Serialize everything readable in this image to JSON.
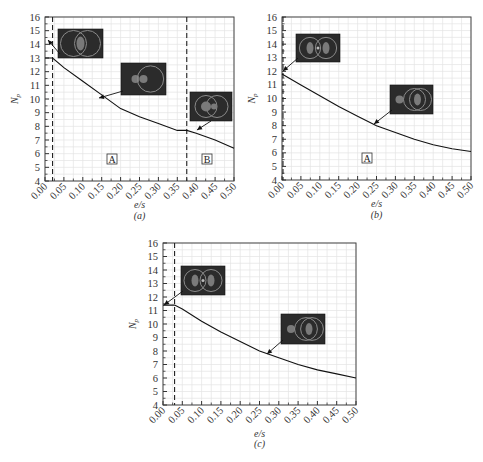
{
  "figure": {
    "panels": [
      {
        "id": "a",
        "caption": "(a)",
        "xlabel": "e/s",
        "ylabel": "N_p",
        "regions": [
          "A",
          "B"
        ],
        "dashed_lines": [
          0.02,
          0.375
        ]
      },
      {
        "id": "b",
        "caption": "(b)",
        "xlabel": "e/s",
        "ylabel": "N_p",
        "regions": [
          "A"
        ],
        "dashed_lines": [
          0.0
        ]
      },
      {
        "id": "c",
        "caption": "(c)",
        "xlabel": "e/s",
        "ylabel": "N_p",
        "regions": [],
        "dashed_lines": [
          0.03
        ]
      }
    ]
  },
  "chart_data": [
    {
      "type": "line",
      "title": "(a)",
      "xlabel": "e/s",
      "ylabel": "N_p",
      "xlim": [
        0,
        0.5
      ],
      "ylim": [
        4,
        16
      ],
      "grid": true,
      "xticks": [
        "0.00",
        "0.05",
        "0.10",
        "0.15",
        "0.20",
        "0.25",
        "0.30",
        "0.35",
        "0.40",
        "0.45",
        "0.50"
      ],
      "yticks": [
        "4",
        "5",
        "6",
        "7",
        "8",
        "9",
        "10",
        "11",
        "12",
        "13",
        "14",
        "15",
        "16"
      ],
      "series": [
        {
          "name": "N_p",
          "x": [
            0,
            0.02,
            0.05,
            0.1,
            0.15,
            0.2,
            0.25,
            0.3,
            0.35,
            0.375,
            0.4,
            0.45,
            0.5
          ],
          "values": [
            13.0,
            13.0,
            12.3,
            11.3,
            10.3,
            9.3,
            8.7,
            8.2,
            7.7,
            7.7,
            7.5,
            7.0,
            6.4
          ]
        }
      ],
      "annotations": [
        "region A",
        "region B",
        "dashed line at e/s≈0.02",
        "dashed line at e/s≈0.375",
        "3 inset images with arrows"
      ]
    },
    {
      "type": "line",
      "title": "(b)",
      "xlabel": "e/s",
      "ylabel": "N_p",
      "xlim": [
        0,
        0.5
      ],
      "ylim": [
        4,
        16
      ],
      "grid": true,
      "xticks": [
        "0.00",
        "0.05",
        "0.10",
        "0.15",
        "0.20",
        "0.25",
        "0.30",
        "0.35",
        "0.40",
        "0.45",
        "0.50"
      ],
      "yticks": [
        "4",
        "5",
        "6",
        "7",
        "8",
        "9",
        "10",
        "11",
        "12",
        "13",
        "14",
        "15",
        "16"
      ],
      "series": [
        {
          "name": "N_p",
          "x": [
            0,
            0.05,
            0.1,
            0.15,
            0.2,
            0.25,
            0.3,
            0.35,
            0.4,
            0.45,
            0.5
          ],
          "values": [
            11.8,
            11.0,
            10.2,
            9.4,
            8.7,
            8.0,
            7.5,
            7.0,
            6.6,
            6.3,
            6.1
          ]
        }
      ],
      "annotations": [
        "region A",
        "dashed line at e/s≈0",
        "2 inset images with arrows"
      ]
    },
    {
      "type": "line",
      "title": "(c)",
      "xlabel": "e/s",
      "ylabel": "N_p",
      "xlim": [
        0,
        0.5
      ],
      "ylim": [
        4,
        16
      ],
      "grid": true,
      "xticks": [
        "0.00",
        "0.05",
        "0.10",
        "0.15",
        "0.20",
        "0.25",
        "0.30",
        "0.35",
        "0.40",
        "0.45",
        "0.50"
      ],
      "yticks": [
        "4",
        "5",
        "6",
        "7",
        "8",
        "9",
        "10",
        "11",
        "12",
        "13",
        "14",
        "15",
        "16"
      ],
      "series": [
        {
          "name": "N_p",
          "x": [
            0,
            0.03,
            0.05,
            0.1,
            0.15,
            0.2,
            0.25,
            0.3,
            0.35,
            0.4,
            0.45,
            0.5
          ],
          "values": [
            11.4,
            11.4,
            11.1,
            10.2,
            9.4,
            8.7,
            8.0,
            7.5,
            7.0,
            6.6,
            6.3,
            6.0
          ]
        }
      ],
      "annotations": [
        "dashed line at e/s≈0.03",
        "2 inset images with arrows"
      ]
    }
  ]
}
